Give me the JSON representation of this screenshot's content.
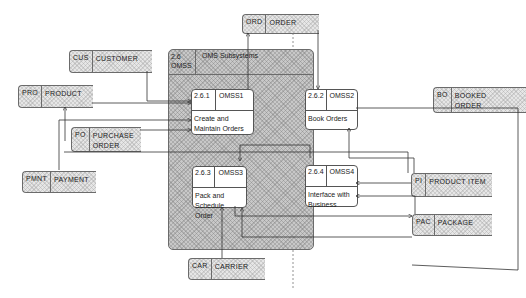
{
  "diagram": {
    "type": "data-flow-diagram",
    "subsystem": {
      "id": "2.6\nOMSS",
      "name": "OMS Subsystems"
    },
    "processes": [
      {
        "id": "2.6.1",
        "code": "OMSS1",
        "name": "Create and\nMaintain Orders"
      },
      {
        "id": "2.6.2",
        "code": "OMSS2",
        "name": "Book Orders"
      },
      {
        "id": "2.6.3",
        "code": "OMSS3",
        "name": "Pack and\nSchedule Order"
      },
      {
        "id": "2.6.4",
        "code": "OMSS4",
        "name": "Interface with\nBusiness"
      }
    ],
    "stores": [
      {
        "id": "ORD",
        "name": "ORDER"
      },
      {
        "id": "CUS",
        "name": "CUSTOMER"
      },
      {
        "id": "PRO",
        "name": "PRODUCT"
      },
      {
        "id": "PO",
        "name": "PURCHASE\nORDER"
      },
      {
        "id": "PMNT",
        "name": "PAYMENT"
      },
      {
        "id": "BO",
        "name": "BOOKED\nORDER"
      },
      {
        "id": "PI",
        "name": "PRODUCT ITEM"
      },
      {
        "id": "PAC",
        "name": "PACKAGE"
      },
      {
        "id": "CAR",
        "name": "CARRIER"
      }
    ]
  }
}
